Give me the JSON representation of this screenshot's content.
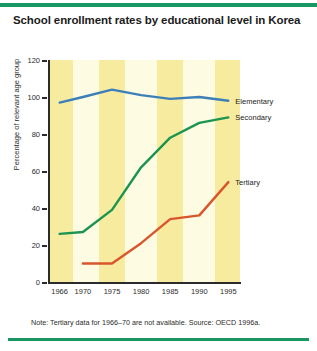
{
  "figure": {
    "title": "School enrollment rates by educational level in Korea",
    "caption": "Note: Tertiary data for 1966–70 are not available. Source: OECD 1996a.",
    "rule_color": "#1a9663",
    "background": "#ffffff",
    "plot_background": "#fdfbe2",
    "band_color": "#f7eba0"
  },
  "chart_data": {
    "type": "line",
    "title": "School enrollment rates by educational level in Korea",
    "xlabel": "",
    "ylabel": "Percentage of relevant age group",
    "x": [
      1966,
      1970,
      1975,
      1980,
      1985,
      1990,
      1995
    ],
    "xtick_labels": [
      "1966",
      "1970",
      "1975",
      "1980",
      "1985",
      "1990",
      "1995"
    ],
    "ytick_labels": [
      "0",
      "20",
      "40",
      "60",
      "80",
      "100",
      "120"
    ],
    "yticks": [
      0,
      20,
      40,
      60,
      80,
      100,
      120
    ],
    "ylim": [
      0,
      120
    ],
    "xlim": [
      1964,
      1997
    ],
    "grid": false,
    "legend_position": "right-inline",
    "series": [
      {
        "name": "Elementary",
        "color": "#3d7fb8",
        "x": [
          1966,
          1970,
          1975,
          1980,
          1985,
          1990,
          1995
        ],
        "values": [
          97,
          100,
          104,
          101,
          99,
          100,
          98
        ]
      },
      {
        "name": "Secondary",
        "color": "#1a9450",
        "x": [
          1966,
          1970,
          1975,
          1980,
          1985,
          1990,
          1995
        ],
        "values": [
          26,
          27,
          39,
          62,
          78,
          86,
          89
        ]
      },
      {
        "name": "Tertiary",
        "color": "#d9562c",
        "x": [
          1970,
          1975,
          1980,
          1985,
          1990,
          1995
        ],
        "values": [
          10,
          10,
          21,
          34,
          36,
          54
        ]
      }
    ]
  }
}
